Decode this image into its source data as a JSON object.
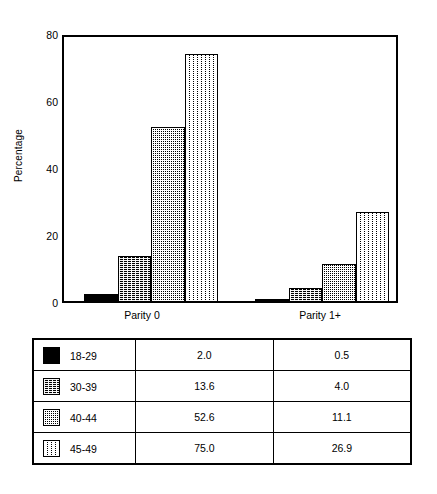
{
  "chart_data": {
    "type": "bar",
    "title": "",
    "xlabel": "",
    "ylabel": "Percentage",
    "categories": [
      "Parity 0",
      "Parity 1+"
    ],
    "ylim": [
      0,
      80
    ],
    "yticks": [
      0,
      20,
      40,
      60,
      80
    ],
    "ytick_labels": [
      "0",
      "20",
      "40",
      "60",
      "80"
    ],
    "grid": false,
    "legend_position": "table-below",
    "series": [
      {
        "name": "18-29",
        "values": [
          2.0,
          0.5
        ],
        "fill": "solid-black",
        "swatch": "s0"
      },
      {
        "name": "30-39",
        "values": [
          13.6,
          4.0
        ],
        "fill": "dither-dark",
        "swatch": "s1"
      },
      {
        "name": "40-44",
        "values": [
          52.6,
          11.1
        ],
        "fill": "dither-medium",
        "swatch": "s2"
      },
      {
        "name": "45-49",
        "values": [
          75.0,
          26.9
        ],
        "fill": "dither-light",
        "swatch": "s3"
      }
    ]
  },
  "table": {
    "rows": [
      {
        "label": "18-29",
        "parity0": "2.0",
        "parity1plus": "0.5"
      },
      {
        "label": "30-39",
        "parity0": "13.6",
        "parity1plus": "4.0"
      },
      {
        "label": "40-44",
        "parity0": "52.6",
        "parity1plus": "11.1"
      },
      {
        "label": "45-49",
        "parity0": "75.0",
        "parity1plus": "26.9"
      }
    ]
  },
  "colors": {
    "axis": "#000000",
    "background": "#ffffff",
    "series_black": "#000000"
  }
}
